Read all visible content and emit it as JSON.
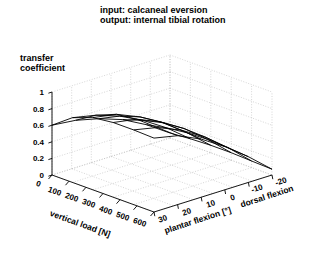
{
  "title": {
    "line1": "input: calcaneal eversion",
    "line2": "output: internal tibial rotation"
  },
  "zaxis_label": {
    "line1": "transfer",
    "line2": "coefficient"
  },
  "chart_data": {
    "type": "surface",
    "zlabel": "transfer coefficient",
    "xlabel": "vertical load [N]",
    "ylabel": "plantar flexion [°]",
    "ylabel_right": "dorsal flexion",
    "zlim": [
      0,
      1
    ],
    "zticks": [
      "0",
      "0.2",
      "0.4",
      "0.6",
      "0.8",
      "1"
    ],
    "ztick_values": [
      0,
      0.2,
      0.4,
      0.6,
      0.8,
      1
    ],
    "xticks": [
      "0",
      "100",
      "200",
      "300",
      "400",
      "500",
      "600"
    ],
    "xtick_values": [
      0,
      100,
      200,
      300,
      400,
      500,
      600
    ],
    "yticks": [
      "30",
      "20",
      "10",
      "0",
      "-10",
      "-20"
    ],
    "ytick_values": [
      30,
      20,
      10,
      0,
      -10,
      -20
    ],
    "grid": true,
    "legend": "none",
    "x": [
      0,
      120,
      240,
      360,
      480,
      600
    ],
    "y": [
      30,
      20,
      10,
      0,
      -10,
      -20
    ],
    "z_rows_note": "rows indexed by vertical load (x), columns by plantar flexion (y, from 30 to -20)",
    "z": [
      [
        0.6,
        0.57,
        0.5,
        0.4,
        0.25,
        0.06
      ],
      [
        0.78,
        0.72,
        0.62,
        0.48,
        0.3,
        0.08
      ],
      [
        0.87,
        0.82,
        0.7,
        0.54,
        0.33,
        0.09
      ],
      [
        0.9,
        0.85,
        0.73,
        0.56,
        0.34,
        0.09
      ],
      [
        0.9,
        0.84,
        0.72,
        0.55,
        0.33,
        0.08
      ],
      [
        0.89,
        0.83,
        0.7,
        0.52,
        0.31,
        0.07
      ]
    ]
  },
  "axes": {
    "x_name": "vertical load  [N]",
    "y_name": "ntar flexion [°]",
    "y_name_full": "plantar flexion [°]",
    "y_name_right": "dorsal flexion",
    "ztick_0": "0",
    "ztick_02": "0.2",
    "ztick_04": "0.4",
    "ztick_06": "0.6",
    "ztick_08": "0.8",
    "ztick_1": "1",
    "xtick_0": "0",
    "xtick_100": "100",
    "xtick_200": "200",
    "xtick_300": "300",
    "xtick_400": "400",
    "xtick_500": "500",
    "xtick_600": "600",
    "ytick_30": "30",
    "ytick_20": "20",
    "ytick_10": "10",
    "ytick_0": "0",
    "ytick_m10": "-10",
    "ytick_m20": "-20"
  },
  "colors": {
    "line": "#000000",
    "grid": "#b9b9b9",
    "background": "#ffffff"
  }
}
